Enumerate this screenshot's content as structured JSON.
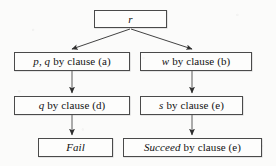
{
  "diagram": {
    "background_color": "#fbfbfa",
    "line_color": "#3c3c3c",
    "box_border_color": "#4a4a4a",
    "text_color": "#121212",
    "nodes": [
      {
        "id": "root",
        "label": "r",
        "italic_part": "r",
        "rest": "",
        "x": 94,
        "y": 10,
        "w": 73,
        "h": 18
      },
      {
        "id": "pq-a",
        "label": "p, q by clause (a)",
        "italic_part": "p, q",
        "rest": "by clause (a)",
        "x": 14,
        "y": 52,
        "w": 116,
        "h": 19
      },
      {
        "id": "w-b",
        "label": "w by clause (b)",
        "italic_part": "w",
        "rest": "by clause (b)",
        "x": 140,
        "y": 52,
        "w": 112,
        "h": 19
      },
      {
        "id": "q-d",
        "label": "q by clause (d)",
        "italic_part": "q",
        "rest": "by clause (d)",
        "x": 14,
        "y": 96,
        "w": 116,
        "h": 19
      },
      {
        "id": "s-e",
        "label": "s by clause (e)",
        "italic_part": "s",
        "rest": "by clause (e)",
        "x": 140,
        "y": 96,
        "w": 103,
        "h": 19
      },
      {
        "id": "fail",
        "label": "Fail",
        "italic_part": "Fail",
        "rest": "",
        "x": 38,
        "y": 138,
        "w": 75,
        "h": 19
      },
      {
        "id": "succeed-e",
        "label": "Succeed by clause (e)",
        "italic_part": "Succeed",
        "rest": "by clause (e)",
        "x": 123,
        "y": 138,
        "w": 139,
        "h": 19
      }
    ],
    "edges": [
      {
        "id": "root-to-pq",
        "from": "root",
        "to": "pq-a",
        "kind": "diagonal-left"
      },
      {
        "id": "root-to-w",
        "from": "root",
        "to": "w-b",
        "kind": "diagonal-right"
      },
      {
        "id": "pq-to-q",
        "from": "pq-a",
        "to": "q-d",
        "kind": "vertical"
      },
      {
        "id": "w-to-s",
        "from": "w-b",
        "to": "s-e",
        "kind": "vertical"
      },
      {
        "id": "q-to-fail",
        "from": "q-d",
        "to": "fail",
        "kind": "vertical"
      },
      {
        "id": "s-to-succeed",
        "from": "s-e",
        "to": "succeed-e",
        "kind": "vertical"
      }
    ]
  }
}
